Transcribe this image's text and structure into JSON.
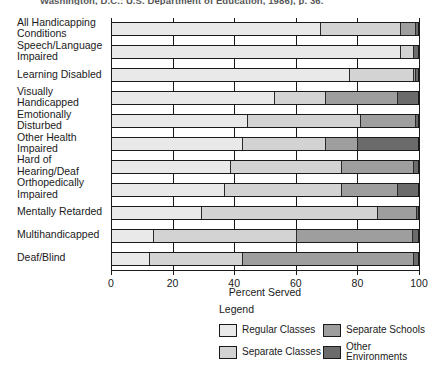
{
  "citation": "Washington, D.C.: U.S. Department of Education, 1986), p. 36.",
  "chart_data": {
    "type": "bar",
    "orientation": "horizontal",
    "stacked": true,
    "percent": true,
    "title": "",
    "xlabel": "Percent Served",
    "ylabel": "",
    "xlim": [
      0,
      100
    ],
    "xticks": [
      0,
      20,
      40,
      60,
      80,
      100
    ],
    "xticklabels": [
      "0",
      "20",
      "40",
      "60",
      "80",
      "100"
    ],
    "grid": true,
    "legend_position": "bottom",
    "legend_title": "Legend",
    "categories": [
      "All Handicapping\nConditions",
      "Speech/Language\nImpaired",
      "Learning Disabled",
      "Visually\nHandicapped",
      "Emotionally\nDisturbed",
      "Other Health\nImpaired",
      "Hard of\nHearing/Deaf",
      "Orthopedically\nImpaired",
      "Mentally Retarded",
      "Multihandicapped",
      "Deaf/Blind"
    ],
    "series": [
      {
        "name": "Regular Classes",
        "color": "#e9e9e9",
        "values": [
          68.0,
          94.0,
          77.5,
          53.0,
          44.0,
          42.5,
          38.5,
          36.5,
          29.0,
          13.5,
          12.0
        ]
      },
      {
        "name": "Separate Classes",
        "color": "#d3d3d3",
        "values": [
          26.0,
          4.5,
          21.0,
          16.5,
          37.0,
          27.0,
          36.5,
          38.5,
          57.5,
          46.5,
          30.5
        ]
      },
      {
        "name": "Separate Schools",
        "color": "#9e9e9e",
        "values": [
          5.0,
          0.0,
          0.5,
          23.5,
          18.0,
          10.5,
          23.5,
          18.0,
          13.0,
          38.0,
          56.0
        ]
      },
      {
        "name": "Other Environments",
        "color": "#6b6b6b",
        "values": [
          1.0,
          1.5,
          1.0,
          7.0,
          1.0,
          20.0,
          1.5,
          7.0,
          0.5,
          2.0,
          1.5
        ]
      }
    ]
  }
}
